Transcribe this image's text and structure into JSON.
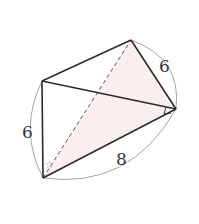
{
  "figure": {
    "type": "folded-rectangle-3d-diagram",
    "vertices": {
      "A": {
        "x": 42,
        "y": 81
      },
      "B": {
        "x": 131,
        "y": 40
      },
      "C": {
        "x": 176,
        "y": 109
      },
      "D": {
        "x": 43,
        "y": 178
      }
    },
    "edges_solid": [
      [
        "A",
        "B"
      ],
      [
        "B",
        "C"
      ],
      [
        "A",
        "C"
      ],
      [
        "A",
        "D"
      ],
      [
        "D",
        "C"
      ]
    ],
    "edges_dashed": [
      [
        "D",
        "B"
      ]
    ],
    "shaded_face": [
      "B",
      "C",
      "D"
    ],
    "labels": {
      "left_length": "6",
      "right_length": "6",
      "bottom_length": "8"
    },
    "angle_marks": {
      "right_angle_at": "C",
      "marked_angle_at": "D",
      "marked_angle_symbol": "☆"
    },
    "colors": {
      "line": "#2b2b2b",
      "dashed": "#555555",
      "arc": "#9a9a9a",
      "shade": "#fbeeee",
      "angle_mark": "#d9777f"
    }
  }
}
